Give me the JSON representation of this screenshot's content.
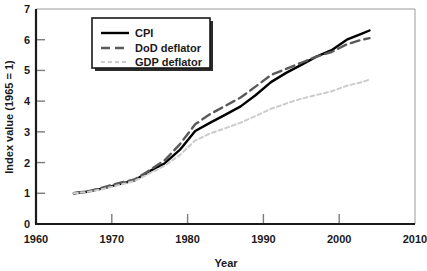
{
  "chart_data": {
    "type": "line",
    "title": "",
    "xlabel": "Year",
    "ylabel": "Index value (1965 = 1)",
    "xlim": [
      1960,
      2010
    ],
    "ylim": [
      0,
      7
    ],
    "xticks": [
      1960,
      1970,
      1980,
      1990,
      2000,
      2010
    ],
    "yticks": [
      0,
      1,
      2,
      3,
      4,
      5,
      6,
      7
    ],
    "grid": false,
    "legend_position": "top-center",
    "x": [
      1965,
      1967,
      1969,
      1971,
      1973,
      1975,
      1977,
      1979,
      1981,
      1983,
      1985,
      1987,
      1989,
      1991,
      1993,
      1995,
      1997,
      1999,
      2001,
      2003,
      2004
    ],
    "series": [
      {
        "name": "CPI",
        "style": "solid",
        "color": "#000000",
        "values": [
          1.0,
          1.06,
          1.17,
          1.3,
          1.42,
          1.72,
          1.98,
          2.42,
          3.03,
          3.3,
          3.56,
          3.83,
          4.2,
          4.62,
          4.92,
          5.18,
          5.45,
          5.66,
          6.0,
          6.2,
          6.3
        ]
      },
      {
        "name": "DoD deflator",
        "style": "dashed",
        "color": "#5a5a5a",
        "values": [
          1.0,
          1.07,
          1.2,
          1.34,
          1.45,
          1.75,
          2.08,
          2.6,
          3.25,
          3.58,
          3.85,
          4.12,
          4.48,
          4.85,
          5.05,
          5.25,
          5.45,
          5.6,
          5.85,
          6.0,
          6.05
        ]
      },
      {
        "name": "GDP deflator",
        "style": "dotted",
        "color": "#cccccc",
        "values": [
          1.0,
          1.05,
          1.15,
          1.27,
          1.4,
          1.65,
          1.9,
          2.25,
          2.72,
          2.95,
          3.12,
          3.3,
          3.52,
          3.75,
          3.92,
          4.08,
          4.2,
          4.32,
          4.5,
          4.62,
          4.7
        ]
      }
    ]
  },
  "legend": {
    "entries": [
      {
        "label": "CPI"
      },
      {
        "label": "DoD deflator"
      },
      {
        "label": "GDP deflator"
      }
    ]
  },
  "axes": {
    "x_tick_labels": [
      "1960",
      "1970",
      "1980",
      "1990",
      "2000",
      "2010"
    ],
    "y_tick_labels": [
      "0",
      "1",
      "2",
      "3",
      "4",
      "5",
      "6",
      "7"
    ],
    "x_axis_title": "Year",
    "y_axis_title": "Index value (1965 = 1)"
  }
}
